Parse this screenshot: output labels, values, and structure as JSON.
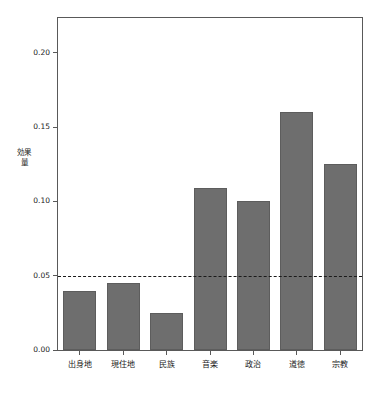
{
  "chart_data": {
    "type": "bar",
    "title": "",
    "subtitle": "",
    "xlabel": "",
    "ylabel": "効果量",
    "categories": [
      "出身地",
      "現住地",
      "民族",
      "音楽",
      "政治",
      "道徳",
      "宗教"
    ],
    "values": [
      0.04,
      0.045,
      0.025,
      0.109,
      0.1,
      0.16,
      0.125
    ],
    "ylim": [
      0,
      0.2235
    ],
    "yticks": [
      0.0,
      0.05,
      0.1,
      0.15,
      0.2
    ],
    "ytick_labels": [
      "0.00",
      "0.05",
      "0.10",
      "0.15",
      "0.20"
    ],
    "grid": false,
    "legend": null,
    "annotations": [
      {
        "name": "threshold-line",
        "type": "hline",
        "value": 0.05,
        "style": "dashed",
        "color": "#1a1a1a"
      }
    ],
    "colors": {
      "bar_fill": "#6e6e6e",
      "bar_edge": "#5d5d5d",
      "frame": "#595959",
      "text": "#1a1a1a",
      "background": "#ffffff"
    }
  }
}
